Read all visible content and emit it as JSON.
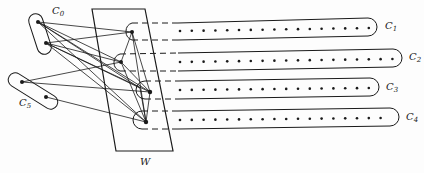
{
  "diagram": {
    "type": "graph-structure",
    "colors": {
      "stroke": "#1a1a1a",
      "background": "#fdfdfd"
    },
    "clusters": [
      {
        "id": "C0",
        "label": "C",
        "subscript": "0",
        "nodes": 2
      },
      {
        "id": "C5",
        "label": "C",
        "subscript": "5",
        "nodes": 2
      },
      {
        "id": "C1",
        "label": "C",
        "subscript": "1",
        "dots": 17
      },
      {
        "id": "C2",
        "label": "C",
        "subscript": "2",
        "dots": 19
      },
      {
        "id": "C3",
        "label": "C",
        "subscript": "3",
        "dots": 17
      },
      {
        "id": "C4",
        "label": "C",
        "subscript": "4",
        "dots": 18
      }
    ],
    "box": {
      "id": "W",
      "label": "W"
    }
  }
}
